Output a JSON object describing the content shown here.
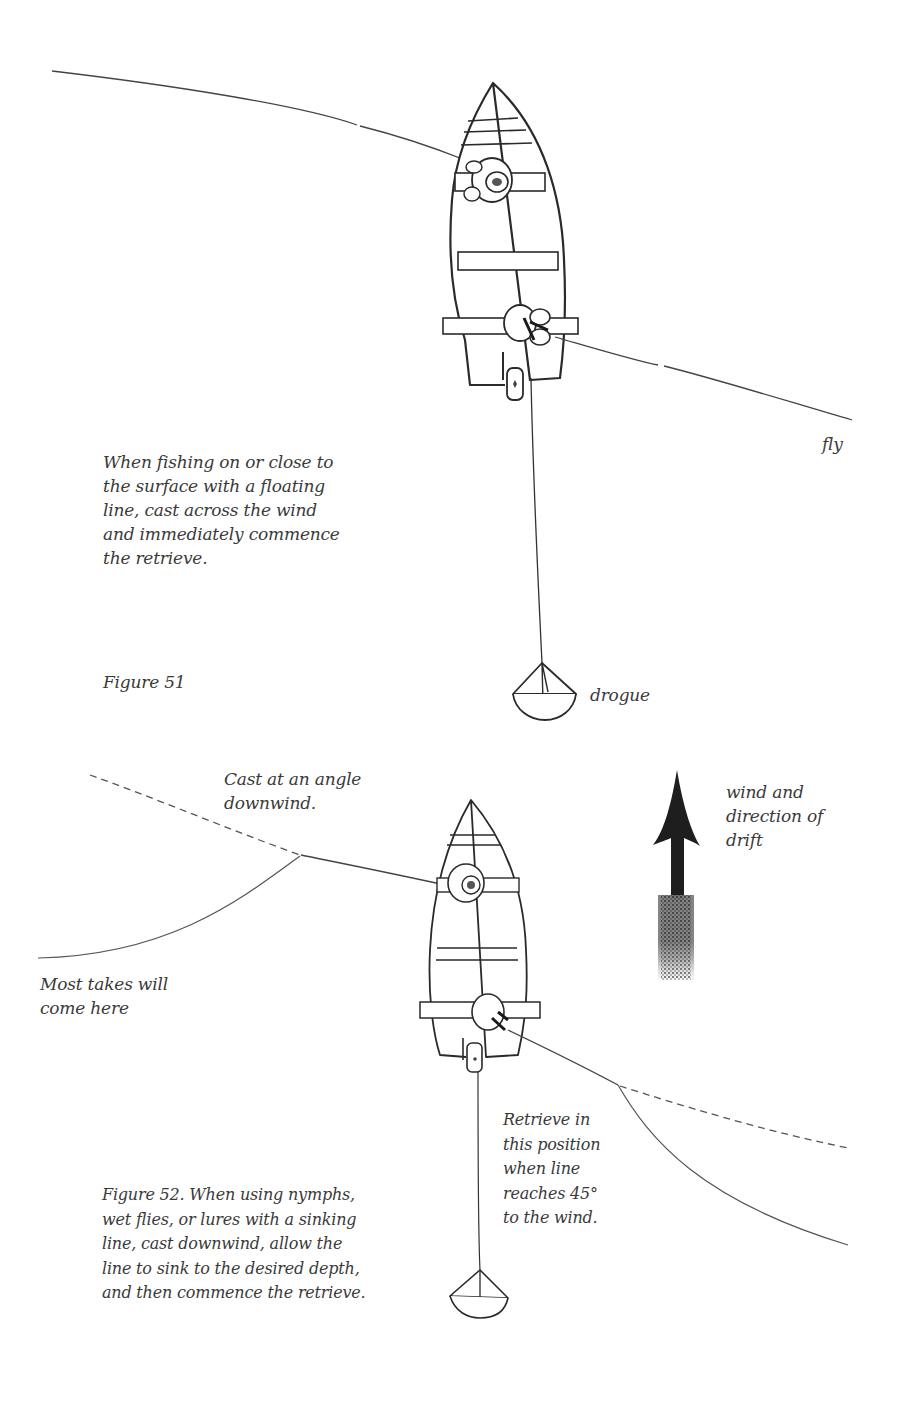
{
  "figure51": {
    "caption": "When fishing on or close to\nthe surface with a floating\nline, cast across the wind\nand immediately commence\nthe retrieve.",
    "title": "Figure 51",
    "labels": {
      "fly": "fly",
      "drogue": "drogue"
    }
  },
  "figure52": {
    "caption": "Figure 52. When using nymphs,\nwet flies, or lures with a sinking\nline, cast downwind, allow the\nline to sink to the desired depth,\nand then commence the retrieve.",
    "labels": {
      "cast_angle": "Cast at an angle\ndownwind.",
      "most_takes": "Most takes will\ncome here",
      "retrieve_position": "Retrieve in\nthis position\nwhen line\nreaches 45°\nto the wind.",
      "wind": "wind and\ndirection of\ndrift"
    }
  },
  "colors": {
    "ink": "#2a2a2a",
    "text": "#3a3a3a",
    "background": "#ffffff"
  }
}
